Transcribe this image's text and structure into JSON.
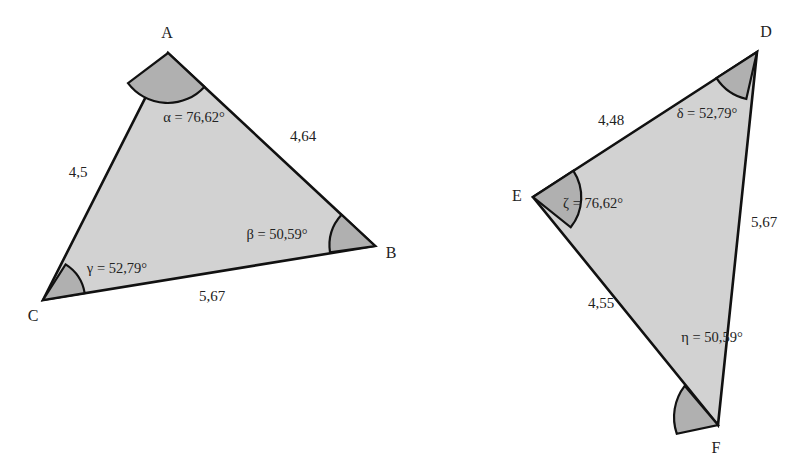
{
  "figure": {
    "background_color": "#ffffff",
    "fill_color": "#d2d2d2",
    "arc_fill_color": "#b0b0b0",
    "stroke_color": "#111111",
    "text_color": "#222222"
  },
  "triangles": [
    {
      "id": "triangle-abc",
      "name": "Triangle ABC",
      "vertices": [
        {
          "name": "A",
          "label": "A",
          "x": 168,
          "y": 53,
          "label_x": 167,
          "label_y": 33
        },
        {
          "name": "B",
          "label": "B",
          "x": 375,
          "y": 246,
          "label_x": 391,
          "label_y": 253
        },
        {
          "name": "C",
          "label": "C",
          "x": 43,
          "y": 300,
          "label_x": 33,
          "label_y": 316
        }
      ],
      "sides": [
        {
          "name": "side-ca",
          "label": "4,5",
          "label_x": 78,
          "label_y": 172
        },
        {
          "name": "side-ab",
          "label": "4,64",
          "label_x": 303,
          "label_y": 136
        },
        {
          "name": "side-cb",
          "label": "5,67",
          "label_x": 212,
          "label_y": 296
        }
      ],
      "angles": [
        {
          "name": "angle-alpha",
          "symbol": "α",
          "label": "α = 76,62°",
          "value": 76.62,
          "at_vertex": "A",
          "label_x": 194,
          "label_y": 117
        },
        {
          "name": "angle-beta",
          "symbol": "β",
          "label": "β = 50,59°",
          "value": 50.59,
          "at_vertex": "B",
          "label_x": 277,
          "label_y": 234
        },
        {
          "name": "angle-gamma",
          "symbol": "γ",
          "label": "γ = 52,79°",
          "value": 52.79,
          "at_vertex": "C",
          "label_x": 117,
          "label_y": 268
        }
      ]
    },
    {
      "id": "triangle-def",
      "name": "Triangle DEF",
      "vertices": [
        {
          "name": "D",
          "label": "D",
          "x": 757,
          "y": 52,
          "label_x": 766,
          "label_y": 32
        },
        {
          "name": "E",
          "label": "E",
          "x": 533,
          "y": 197,
          "label_x": 517,
          "label_y": 196
        },
        {
          "name": "F",
          "label": "F",
          "x": 718,
          "y": 425,
          "label_x": 716,
          "label_y": 448
        }
      ],
      "sides": [
        {
          "name": "side-ed",
          "label": "4,48",
          "label_x": 611,
          "label_y": 120
        },
        {
          "name": "side-df",
          "label": "5,67",
          "label_x": 764,
          "label_y": 222
        },
        {
          "name": "side-ef",
          "label": "4,55",
          "label_x": 601,
          "label_y": 303
        }
      ],
      "angles": [
        {
          "name": "angle-delta",
          "symbol": "δ",
          "label": "δ = 52,79°",
          "value": 52.79,
          "at_vertex": "D",
          "label_x": 707,
          "label_y": 113
        },
        {
          "name": "angle-zeta",
          "symbol": "ζ",
          "label": "ζ = 76,62°",
          "value": 76.62,
          "at_vertex": "E",
          "label_x": 593,
          "label_y": 203
        },
        {
          "name": "angle-eta",
          "symbol": "η",
          "label": "η = 50,59°",
          "value": 50.59,
          "at_vertex": "F",
          "label_x": 712,
          "label_y": 337
        }
      ]
    }
  ]
}
